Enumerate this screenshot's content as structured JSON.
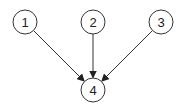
{
  "diagram": {
    "type": "directed-graph",
    "nodes": [
      {
        "id": "1",
        "label": "1",
        "cx": 25,
        "cy": 22
      },
      {
        "id": "2",
        "label": "2",
        "cx": 93,
        "cy": 22
      },
      {
        "id": "3",
        "label": "3",
        "cx": 161,
        "cy": 22
      },
      {
        "id": "4",
        "label": "4",
        "cx": 93,
        "cy": 90
      }
    ],
    "edges": [
      {
        "from": "1",
        "to": "4"
      },
      {
        "from": "2",
        "to": "4"
      },
      {
        "from": "3",
        "to": "4"
      }
    ],
    "node_radius": 12,
    "stroke_color": "#333333"
  }
}
